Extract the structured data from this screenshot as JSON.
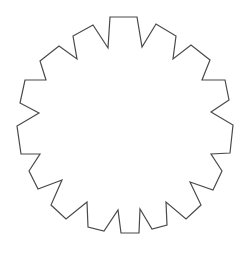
{
  "diagram": {
    "shape": "gear-outline",
    "teeth": 16,
    "stroke_color": "#4a4a4a",
    "fill_color": "#ffffff",
    "background": "#ffffff",
    "stroke_width": 1.2,
    "points": "110,17 137,17 142,47 156,24 176,36 173,59 191,45 210,60 202,80 225,80 229,100 211,112 233,125 230,153 211,154 222,171 213,190 190,182 201,205 186,219 166,202 167,225 152,229 140,209 139,233 121,233 118,210 104,231 88,227 87,202 66,219 51,205 62,180 38,189 29,171 40,154 21,154 17,126 39,113 20,103 25,80 46,80 40,61 59,46 77,59 73,36 93,25 108,48"
  }
}
